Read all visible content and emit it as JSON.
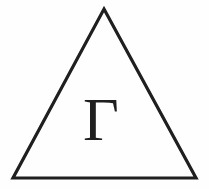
{
  "figure": {
    "name": "triangle-with-cyrillic-gamma",
    "background_color": "#fefefe",
    "ink_color": "#201f1f",
    "width": 209,
    "height": 189
  },
  "triangle": {
    "name": "triangle-outline",
    "apex": {
      "x": 104,
      "y": 9
    },
    "bottom_left": {
      "x": 13,
      "y": 178
    },
    "bottom_right": {
      "x": 196,
      "y": 178
    },
    "stroke_width": 3.2,
    "stroke_color": "#201f1f",
    "fill": "none"
  },
  "letter": {
    "name": "cyrillic-ghe",
    "character": "Г",
    "transliteration": "G",
    "color": "#201f1f",
    "center": {
      "x": 101,
      "y": 115
    },
    "bounds": {
      "left": 80,
      "top": 90,
      "right": 123,
      "bottom": 140
    }
  }
}
